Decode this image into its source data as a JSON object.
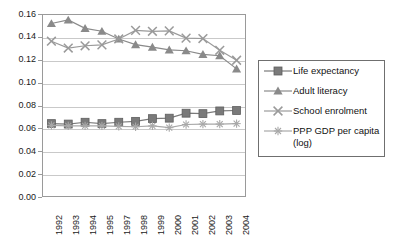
{
  "chart_data": {
    "type": "line",
    "title": "",
    "subtitle": "",
    "xlabel": "",
    "ylabel": "",
    "ylim": [
      0.0,
      0.16
    ],
    "ytick_step": 0.02,
    "grid": true,
    "legend_position": "right",
    "categories": [
      "1992",
      "1993",
      "1994",
      "1995",
      "1997",
      "1998",
      "1999",
      "2000",
      "2001",
      "2002",
      "2003",
      "2004"
    ],
    "ytick_labels": [
      "0.00",
      "0.02",
      "0.04",
      "0.06",
      "0.08",
      "0.10",
      "0.12",
      "0.14",
      "0.16"
    ],
    "ytick_values": [
      0.0,
      0.02,
      0.04,
      0.06,
      0.08,
      0.1,
      0.12,
      0.14,
      0.16
    ],
    "series": [
      {
        "name": "Life expectancy",
        "marker": "square",
        "color": "#7a7a7a",
        "values": [
          0.064,
          0.0636,
          0.0652,
          0.064,
          0.0652,
          0.066,
          0.0684,
          0.0688,
          0.0732,
          0.0728,
          0.0752,
          0.0756
        ]
      },
      {
        "name": "Adult literacy",
        "marker": "triangle",
        "color": "#8a8a8a",
        "values": [
          0.1525,
          0.1556,
          0.1482,
          0.1456,
          0.1388,
          0.1338,
          0.1316,
          0.1292,
          0.1284,
          0.1252,
          0.124,
          0.1124
        ]
      },
      {
        "name": "School enrolment",
        "marker": "x",
        "color": "#9a9a9a",
        "values": [
          0.1368,
          0.1308,
          0.1328,
          0.1336,
          0.1388,
          0.1464,
          0.1456,
          0.146,
          0.1396,
          0.1392,
          0.1288,
          0.12
        ]
      },
      {
        "name": "PPP GDP per capita (log)",
        "marker": "asterisk",
        "color": "#a8a8a8",
        "values": [
          0.0624,
          0.062,
          0.062,
          0.062,
          0.0616,
          0.0612,
          0.062,
          0.0604,
          0.0632,
          0.0636,
          0.0636,
          0.064
        ]
      }
    ]
  },
  "legend": {
    "items": [
      {
        "label": "Life expectancy",
        "cont": ""
      },
      {
        "label": "Adult literacy",
        "cont": ""
      },
      {
        "label": "School enrolment",
        "cont": ""
      },
      {
        "label": "PPP GDP per capita",
        "cont": "(log)"
      }
    ]
  },
  "colors": {
    "grid": "#c9c9c9",
    "frame": "#9a9a9a",
    "legend_border": "#6f6f6f",
    "background": "#ffffff",
    "text": "#1a1a1a"
  }
}
